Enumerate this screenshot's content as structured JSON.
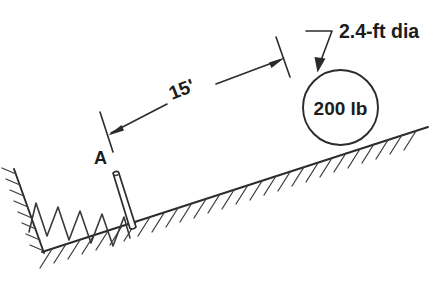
{
  "figure": {
    "type": "engineering-mechanics-diagram",
    "background_color": "#ffffff",
    "line_color": "#2b2b2b",
    "width": 441,
    "height": 283,
    "cropped_text_top": "",
    "labels": {
      "diameter": "2.4-ft dia",
      "weight": "200 lb",
      "distance": "15'",
      "point": "A"
    }
  },
  "annotations": {
    "diameter_label": "2.4-ft dia",
    "ball_label": "200 lb",
    "dimension_label": "15'",
    "point_label": "A"
  },
  "elements": {
    "incline": "inclined-plane-hatched",
    "wall": "vertical-wall-hatched",
    "spring": "coil-spring",
    "block": "plunger-plate",
    "ball": "circular-ball",
    "dimension": "dimension-line-15ft",
    "leader": "leader-line-diameter"
  }
}
